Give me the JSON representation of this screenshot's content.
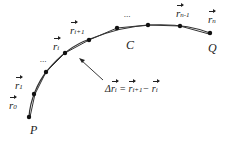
{
  "diagram": {
    "points": {
      "P": "P",
      "Q": "Q",
      "C": "C"
    },
    "vectors": {
      "r0": {
        "base": "r",
        "sub": "0"
      },
      "r1": {
        "base": "r",
        "sub": "1"
      },
      "ri": {
        "base": "r",
        "sub": "i"
      },
      "ri1": {
        "base": "r",
        "sub": "i+1"
      },
      "rn1": {
        "base": "r",
        "sub": "n-1"
      },
      "rn": {
        "base": "r",
        "sub": "n"
      }
    },
    "ellipsis": [
      "...",
      "..."
    ],
    "equation": {
      "delta": "Δ",
      "lhs_base": "r",
      "lhs_sub": "i",
      "equals": "=",
      "t1_base": "r",
      "t1_sub": "i+1",
      "minus": "−",
      "t2_base": "r",
      "t2_sub": "i"
    }
  }
}
